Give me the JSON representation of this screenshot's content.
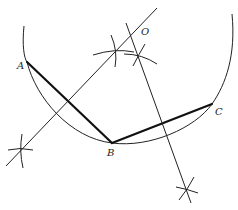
{
  "diagram": {
    "type": "geometric-construction",
    "points": {
      "A": {
        "label": "A",
        "x": 27,
        "y": 62
      },
      "B": {
        "label": "B",
        "x": 112,
        "y": 143
      },
      "C": {
        "label": "C",
        "x": 212,
        "y": 104
      },
      "O": {
        "label": "O",
        "x": 143,
        "y": 30
      }
    },
    "chords": [
      {
        "from": "A",
        "to": "B"
      },
      {
        "from": "B",
        "to": "C"
      }
    ],
    "bisectors": [
      {
        "name": "perpendicular-bisector-AB",
        "from": [
          6,
          166
        ],
        "to": [
          157,
          8
        ]
      },
      {
        "name": "perpendicular-bisector-BC",
        "from": [
          126,
          23
        ],
        "to": [
          191,
          203
        ]
      }
    ],
    "arc": {
      "start": [
        24,
        26
      ],
      "end": [
        232,
        14
      ]
    },
    "labels": {
      "A": "A",
      "B": "B",
      "C": "C",
      "O": "O"
    }
  }
}
